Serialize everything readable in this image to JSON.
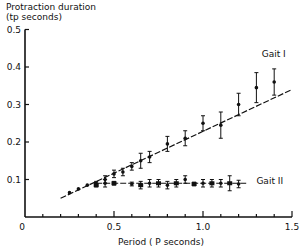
{
  "chart_data": {
    "type": "scatter",
    "title": "",
    "ylabel_line1": "Protraction duration",
    "ylabel_line2": "(tp seconds)",
    "xlabel": "Period ( P seconds)",
    "xlim": [
      0,
      1.5
    ],
    "ylim": [
      0,
      0.5
    ],
    "xticks": [
      0,
      0.5,
      1.0,
      1.5
    ],
    "xtick_labels": [
      "0",
      "0.5",
      "1.0",
      "1.5"
    ],
    "yticks": [
      0.1,
      0.2,
      0.3,
      0.4,
      0.5
    ],
    "ytick_labels": [
      "0.1",
      "0.2",
      "0.3",
      "0.4",
      "0.5"
    ],
    "grid": false,
    "series": [
      {
        "name": "Gait I",
        "marker": "circle",
        "x": [
          0.25,
          0.3,
          0.35,
          0.4,
          0.45,
          0.5,
          0.55,
          0.6,
          0.65,
          0.7,
          0.8,
          0.9,
          1.0,
          1.1,
          1.2,
          1.3,
          1.4
        ],
        "y": [
          0.065,
          0.075,
          0.085,
          0.09,
          0.1,
          0.115,
          0.12,
          0.135,
          0.15,
          0.16,
          0.195,
          0.21,
          0.25,
          0.245,
          0.3,
          0.345,
          0.36
        ],
        "err": [
          0,
          0,
          0,
          0.005,
          0.01,
          0.01,
          0.01,
          0.01,
          0.02,
          0.015,
          0.02,
          0.02,
          0.02,
          0.035,
          0.03,
          0.04,
          0.035
        ],
        "fit_line": {
          "x": [
            0.2,
            1.5
          ],
          "y": [
            0.05,
            0.34
          ],
          "style": "dashed"
        }
      },
      {
        "name": "Gait II",
        "marker": "square/circle",
        "x": [
          0.4,
          0.45,
          0.5,
          0.6,
          0.65,
          0.7,
          0.75,
          0.8,
          0.85,
          0.9,
          0.95,
          1.0,
          1.05,
          1.1,
          1.15,
          1.2
        ],
        "y": [
          0.085,
          0.09,
          0.09,
          0.088,
          0.085,
          0.09,
          0.09,
          0.085,
          0.09,
          0.1,
          0.088,
          0.09,
          0.09,
          0.09,
          0.09,
          0.088
        ],
        "err": [
          0.005,
          0.01,
          0.005,
          0.005,
          0.01,
          0.01,
          0.01,
          0.01,
          0.01,
          0.01,
          0.005,
          0.01,
          0.01,
          0.01,
          0.02,
          0.01
        ],
        "fit_line": {
          "x": [
            0.4,
            1.25
          ],
          "y": [
            0.09,
            0.09
          ],
          "style": "dashed"
        }
      }
    ],
    "annotations": [
      {
        "text": "Gait I",
        "x": 1.33,
        "y": 0.435
      },
      {
        "text": "Gait II",
        "x": 1.3,
        "y": 0.095
      }
    ]
  }
}
